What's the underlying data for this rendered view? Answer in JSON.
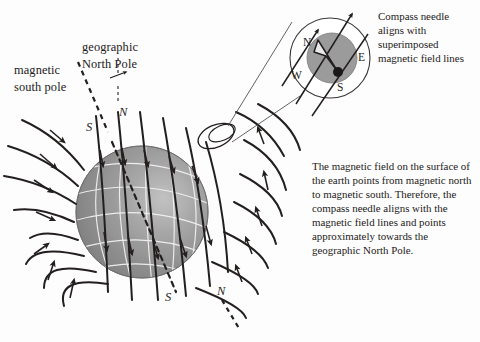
{
  "figure": {
    "background_color": "#fdfdfd",
    "ink_color": "#241f1f",
    "earth_fill": "#8e8e8e",
    "earth_highlight": "#bcbcbc",
    "graticule_color": "#f2f2f2"
  },
  "labels": {
    "magnetic_south_pole": "magnetic\nsouth pole",
    "magnetic_south_pole_line1": "magnetic",
    "magnetic_south_pole_line2": "south pole",
    "geographic_north_pole_line1": "geographic",
    "geographic_north_pole_line2": "North Pole",
    "pole_top_s": "S",
    "pole_top_n": "N",
    "pole_bottom_s": "S",
    "pole_bottom_n": "N"
  },
  "compass": {
    "north": "N",
    "east": "E",
    "south": "S",
    "west": "W",
    "needle": "compass-needle-arrow",
    "caption_line1": "Compass needle",
    "caption_line2": "aligns with",
    "caption_line3": "superimposed",
    "caption_line4": "magnetic field lines"
  },
  "body": {
    "line1": "The magnetic field on the surface of",
    "line2": "the earth points from magnetic north",
    "line3": "to magnetic south. Therefore, the",
    "line4": "compass needle aligns with the",
    "line5": "magnetic field lines and points",
    "line6": "approximately towards the",
    "line7": "geographic North Pole."
  }
}
